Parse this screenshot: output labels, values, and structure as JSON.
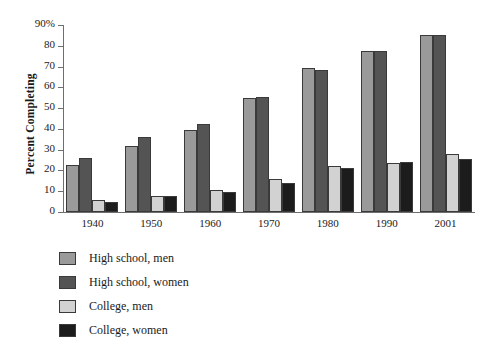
{
  "chart_data": {
    "type": "bar",
    "title": "",
    "xlabel": "",
    "ylabel": "Percent Completing",
    "ylim": [
      0,
      90
    ],
    "yticks": [
      0,
      10,
      20,
      30,
      40,
      50,
      60,
      70,
      80,
      90
    ],
    "ytick_labels": [
      "0",
      "10",
      "20",
      "30",
      "40",
      "50",
      "60",
      "70",
      "80",
      "90%"
    ],
    "grid": false,
    "legend_position": "below-left",
    "categories": [
      "1940",
      "1950",
      "1960",
      "1970",
      "1980",
      "1990",
      "2001"
    ],
    "series": [
      {
        "name": "High school, men",
        "color": "#9a9a9a",
        "values": [
          22.5,
          32,
          39.5,
          55,
          69.5,
          77.5,
          85
        ]
      },
      {
        "name": "High school, women",
        "color": "#545454",
        "values": [
          26,
          36,
          42.5,
          55.5,
          68.5,
          77.5,
          85
        ]
      },
      {
        "name": "College, men",
        "color": "#d2d2d2",
        "values": [
          6,
          7.5,
          10.5,
          16,
          22,
          23.5,
          28
        ]
      },
      {
        "name": "College, women",
        "color": "#1c1c1c",
        "values": [
          5,
          7.5,
          9.5,
          14,
          21,
          24,
          25.5
        ]
      }
    ]
  },
  "axis": {
    "y_title": "Percent Completing"
  },
  "colors": {
    "series_0": "#9a9a9a",
    "series_1": "#545454",
    "series_2": "#d2d2d2",
    "series_3": "#1c1c1c",
    "axis": "#6e6e6e",
    "background": "#ffffff"
  }
}
